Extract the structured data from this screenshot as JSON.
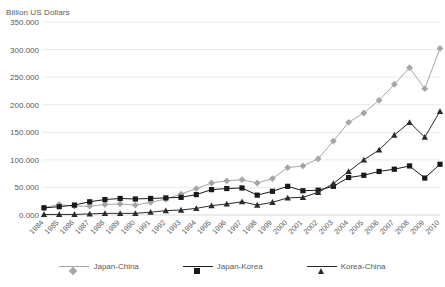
{
  "chart_data": {
    "type": "line",
    "title": "",
    "xlabel": "",
    "ylabel": "Billion US Dollars",
    "ylim": [
      0,
      350
    ],
    "ytick_step": 50,
    "ytick_labels": [
      "0.000",
      "50.000",
      "100.000",
      "150.000",
      "200.000",
      "250.000",
      "300.000",
      "350.000"
    ],
    "grid": true,
    "legend_position": "bottom",
    "categories": [
      "1984",
      "1985",
      "1986",
      "1987",
      "1988",
      "1989",
      "1990",
      "1991",
      "1992",
      "1993",
      "1994",
      "1995",
      "1996",
      "1997",
      "1998",
      "1999",
      "2000",
      "2001",
      "2002",
      "2003",
      "2004",
      "2005",
      "2006",
      "2007",
      "2008",
      "2009",
      "2010"
    ],
    "series": [
      {
        "name": "Japan-China",
        "color": "#a6a6a6",
        "marker": "diamond",
        "values": [
          13,
          19,
          16,
          16,
          19,
          20,
          18,
          23,
          29,
          38,
          48,
          58,
          62,
          64,
          58,
          66,
          86,
          89,
          102,
          134,
          168,
          185,
          208,
          237,
          267,
          229,
          302
        ]
      },
      {
        "name": "Japan-Korea",
        "color": "#1a1a1a",
        "marker": "square",
        "values": [
          13,
          15,
          18,
          24,
          28,
          30,
          29,
          30,
          31,
          32,
          37,
          46,
          48,
          49,
          36,
          43,
          52,
          44,
          45,
          52,
          68,
          72,
          79,
          83,
          89,
          67,
          92
        ]
      },
      {
        "name": "Korea-China",
        "color": "#2b2b2b",
        "marker": "triangle",
        "values": [
          1,
          1,
          1,
          2,
          3,
          3,
          3,
          5,
          8,
          9,
          12,
          17,
          20,
          24,
          18,
          23,
          31,
          32,
          41,
          57,
          79,
          100,
          118,
          145,
          168,
          141,
          188
        ]
      }
    ]
  },
  "legend": {
    "items": [
      {
        "label": "Japan-China"
      },
      {
        "label": "Japan-Korea"
      },
      {
        "label": "Korea-China"
      }
    ]
  }
}
